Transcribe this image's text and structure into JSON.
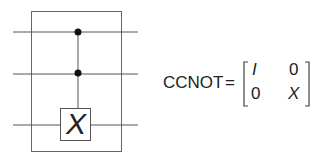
{
  "circuit": {
    "wires": 3,
    "controls": [
      "wire-1",
      "wire-2"
    ],
    "target_gate": "X",
    "stroke_color": "#555555"
  },
  "equation": {
    "lhs": "CCNOT",
    "equals": "=",
    "matrix": [
      [
        "I",
        "0"
      ],
      [
        "0",
        "X"
      ]
    ]
  }
}
